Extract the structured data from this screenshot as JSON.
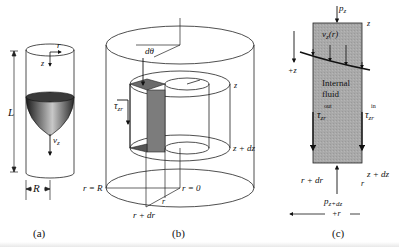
{
  "figure": {
    "panels": [
      {
        "id": "a",
        "caption": "(a)",
        "description": "Tube of radius R and length L with parabolic velocity profile",
        "labels": {
          "r_axis": "r",
          "z_axis": "z",
          "length": "L",
          "velocity": "v",
          "velocity_sub": "z",
          "radius": "R"
        }
      },
      {
        "id": "b",
        "caption": "(b)",
        "description": "Cylindrical shell control volume in a pipe",
        "labels": {
          "d_theta": "dθ",
          "tau": "τ",
          "tau_sub": "zr",
          "z_top": "z",
          "z_bottom": "z + dz",
          "r_eq_R": "r = R",
          "r_eq_0": "r = 0",
          "r": "r",
          "r_plus_dr": "r + dr"
        }
      },
      {
        "id": "c",
        "caption": "(c)",
        "description": "Force balance on shell element",
        "labels": {
          "p_top": "p",
          "p_top_sub": "z",
          "z_top": "z",
          "velocity": "v",
          "velocity_sub": "z",
          "velocity_arg": "(r)",
          "plus_z": "+z",
          "internal_fluid_line1": "Internal",
          "internal_fluid_line2": "fluid",
          "tau_out": "τ",
          "tau_out_sub": "zr",
          "tau_out_sup": "out",
          "tau_in": "τ",
          "tau_in_sub": "zr",
          "tau_in_sup": "in",
          "r_plus_dr": "r + dr",
          "r": "r",
          "z_plus_dz": "z + dz",
          "p_bottom": "p",
          "p_bottom_sub": "z+dz",
          "plus_r": "+r"
        }
      }
    ],
    "colors": {
      "line": "#222222",
      "shell_fill": "#7a7a7a",
      "element_fill": "#a8a8a8",
      "profile_dark": "#1a1a1a",
      "profile_light": "#bdbdbd"
    }
  }
}
